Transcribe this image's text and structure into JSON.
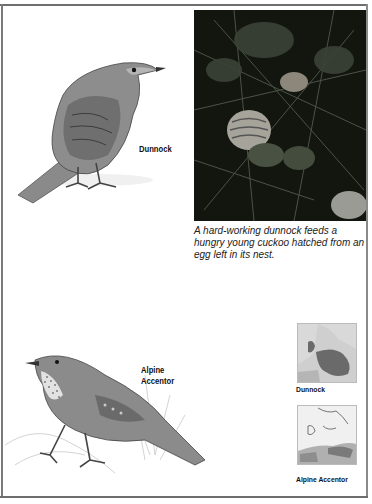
{
  "page": {
    "background": "#ffffff",
    "frame_color": "#6e6e6e"
  },
  "dunnock_illustration": {
    "label": "Dunnock",
    "description": "Drawing of a dunnock perched on the ground"
  },
  "photo": {
    "description": "Dunnock feeding a young cuckoo in a dark leafy nest",
    "caption": "A hard-working dunnock feeds a hungry young cuckoo hatched from an egg left in its nest."
  },
  "alpine_accentor_illustration": {
    "label_line1": "Alpine",
    "label_line2": "Accentor",
    "description": "Drawing of an alpine accentor perched on a rock with grasses"
  },
  "maps": [
    {
      "label": "Dunnock",
      "range_color": "#6a6a6a"
    },
    {
      "label": "Alpine Accentor",
      "range_color": "#7a7a7a"
    }
  ]
}
